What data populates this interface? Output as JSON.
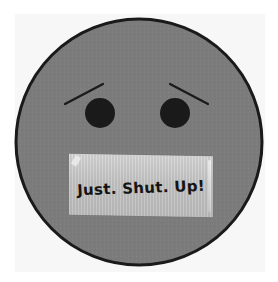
{
  "image": {
    "subject": "sad face with tape over mouth",
    "tape_label": "Just. Shut. Up!"
  },
  "colors": {
    "background": "#ffffff",
    "panel": "#f7f7f7",
    "face_fill": "#7c7c7c",
    "face_outline": "#1a1a1a",
    "eyes": "#1a1a1a",
    "brows": "#1a1a1a",
    "tape": "#c6c6c6",
    "tape_text": "#141414"
  },
  "face": {
    "center": [
      139,
      142
    ],
    "radius": 123
  }
}
